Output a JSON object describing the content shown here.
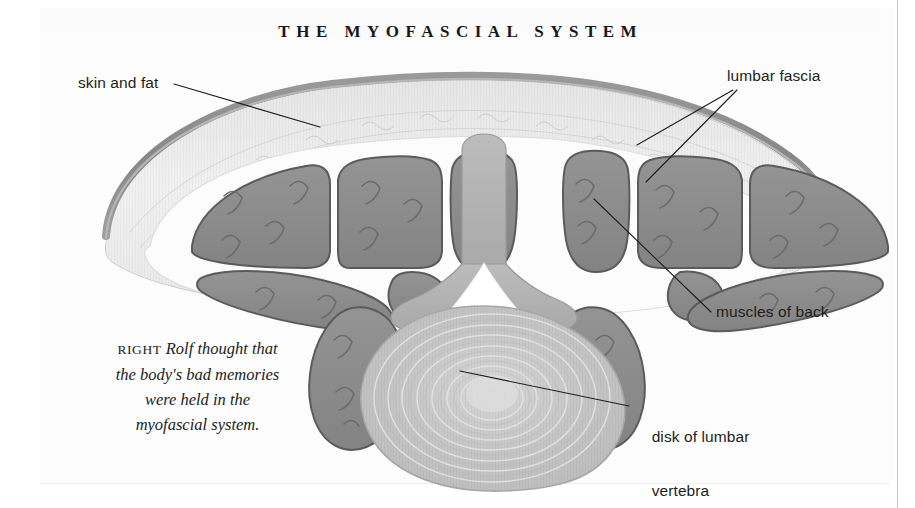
{
  "page": {
    "title": "THE MYOFASCIAL SYSTEM",
    "background_color": "#ffffff",
    "plate_color": "#fdfdfd"
  },
  "labels": {
    "skin_and_fat": "skin and fat",
    "lumbar_fascia": "lumbar fascia",
    "muscles_of_back": "muscles of back",
    "disk_of_lumbar_vertebra_line1": "disk of lumbar",
    "disk_of_lumbar_vertebra_line2": "vertebra"
  },
  "caption": {
    "kicker": "RIGHT",
    "line1": "Rolf thought that",
    "line2": "the body's bad memories",
    "line3": "were held in the",
    "line4": "myofascial system."
  },
  "illustration": {
    "type": "anatomical-cross-section",
    "region": "lumbar spine transverse section",
    "structures": [
      "skin",
      "subcutaneous fat",
      "lumbar fascia",
      "erector spinae muscles",
      "quadratus lumborum",
      "spinous process",
      "vertebral lamina",
      "spinal canal",
      "intervertebral disk"
    ],
    "colors": {
      "skin_line": "#8d8d8d",
      "fat": "#ededed",
      "fascia": "#fbfbfb",
      "muscle_fill": "#8b8b8b",
      "muscle_outline": "#575757",
      "bone_fill": "#b4b4b4",
      "disk_fill": "#c8c8c8",
      "disk_ring": "#dddddd",
      "canal": "#ffffff",
      "leader_line": "#1d1e20"
    }
  }
}
